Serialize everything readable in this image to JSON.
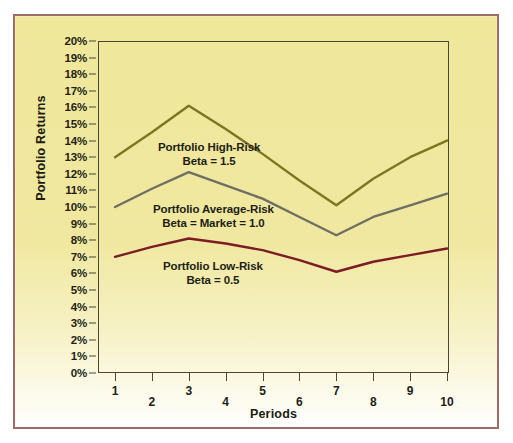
{
  "figure": {
    "border_color": "#9c6b63",
    "background_top": "#efe79a",
    "background_bottom": "#ffffff"
  },
  "axes": {
    "y_title": "Portfolio Returns",
    "x_title": "Periods",
    "y_ticks": [
      "20%",
      "19%",
      "18%",
      "17%",
      "16%",
      "15%",
      "14%",
      "13%",
      "12%",
      "11%",
      "10%",
      "9%",
      "8%",
      "7%",
      "6%",
      "5%",
      "4%",
      "3%",
      "2%",
      "1%",
      "0%"
    ],
    "x_ticks": [
      "1",
      "2",
      "3",
      "4",
      "5",
      "6",
      "7",
      "8",
      "9",
      "10"
    ]
  },
  "annotations": [
    {
      "name": "high-risk-label",
      "line1": "Portfolio High-Risk",
      "line2": "Beta = 1.5"
    },
    {
      "name": "average-risk-label",
      "line1": "Portfolio Average-Risk",
      "line2": "Beta = Market = 1.0"
    },
    {
      "name": "low-risk-label",
      "line1": "Portfolio Low-Risk",
      "line2": "Beta = 0.5"
    }
  ],
  "chart_data": {
    "type": "line",
    "title": "",
    "xlabel": "Periods",
    "ylabel": "Portfolio Returns",
    "x": [
      1,
      2,
      3,
      4,
      5,
      6,
      7,
      8,
      9,
      10
    ],
    "xlim": [
      1,
      10
    ],
    "ylim": [
      0,
      20
    ],
    "ytick_step": 1,
    "ytick_suffix": "%",
    "grid": false,
    "legend": "inline-annotations",
    "series": [
      {
        "name": "Portfolio High-Risk",
        "beta": "1.5",
        "color": "#7c7622",
        "values": [
          13.0,
          14.5,
          16.1,
          14.7,
          13.2,
          11.6,
          10.1,
          11.7,
          13.0,
          14.0
        ]
      },
      {
        "name": "Portfolio Average-Risk",
        "beta": "Market = 1.0",
        "color": "#6f6f64",
        "values": [
          10.0,
          11.1,
          12.1,
          11.3,
          10.5,
          9.4,
          8.3,
          9.4,
          10.1,
          10.8
        ]
      },
      {
        "name": "Portfolio Low-Risk",
        "beta": "0.5",
        "color": "#7c1c24",
        "values": [
          7.0,
          7.6,
          8.1,
          7.8,
          7.4,
          6.8,
          6.1,
          6.7,
          7.1,
          7.5
        ]
      }
    ]
  }
}
